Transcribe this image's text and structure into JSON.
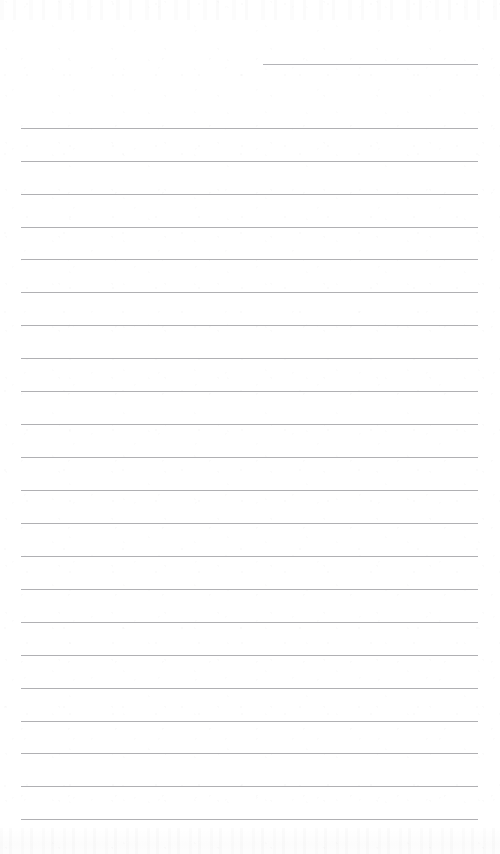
{
  "document": {
    "type": "lined-notebook-page",
    "title": "",
    "page_width": 500,
    "page_height": 854,
    "background_color": "#ffffff",
    "rule_color": "#a9a9ad",
    "rule_thickness_px": 1,
    "content_text": "",
    "is_blank": true
  },
  "layout": {
    "left_margin_x": 21,
    "right_margin_x": 478,
    "full_rule_width": 457,
    "first_full_rule_y": 128,
    "rule_spacing_px": 32.9,
    "full_rule_count": 22
  },
  "header_rule": {
    "name": "signature-rule",
    "label": "",
    "x": 263,
    "y": 64,
    "width": 215
  },
  "rules": [
    {
      "index": 1,
      "y": 128,
      "x": 21,
      "width": 457,
      "value": ""
    },
    {
      "index": 2,
      "y": 161,
      "x": 21,
      "width": 457,
      "value": ""
    },
    {
      "index": 3,
      "y": 194,
      "x": 21,
      "width": 457,
      "value": ""
    },
    {
      "index": 4,
      "y": 227,
      "x": 21,
      "width": 457,
      "value": ""
    },
    {
      "index": 5,
      "y": 259,
      "x": 21,
      "width": 457,
      "value": ""
    },
    {
      "index": 6,
      "y": 292,
      "x": 21,
      "width": 457,
      "value": ""
    },
    {
      "index": 7,
      "y": 325,
      "x": 21,
      "width": 457,
      "value": ""
    },
    {
      "index": 8,
      "y": 358,
      "x": 21,
      "width": 457,
      "value": ""
    },
    {
      "index": 9,
      "y": 391,
      "x": 21,
      "width": 457,
      "value": ""
    },
    {
      "index": 10,
      "y": 424,
      "x": 21,
      "width": 457,
      "value": ""
    },
    {
      "index": 11,
      "y": 457,
      "x": 21,
      "width": 457,
      "value": ""
    },
    {
      "index": 12,
      "y": 490,
      "x": 21,
      "width": 457,
      "value": ""
    },
    {
      "index": 13,
      "y": 523,
      "x": 21,
      "width": 457,
      "value": ""
    },
    {
      "index": 14,
      "y": 556,
      "x": 21,
      "width": 457,
      "value": ""
    },
    {
      "index": 15,
      "y": 589,
      "x": 21,
      "width": 457,
      "value": ""
    },
    {
      "index": 16,
      "y": 622,
      "x": 21,
      "width": 457,
      "value": ""
    },
    {
      "index": 17,
      "y": 655,
      "x": 21,
      "width": 457,
      "value": ""
    },
    {
      "index": 18,
      "y": 688,
      "x": 21,
      "width": 457,
      "value": ""
    },
    {
      "index": 19,
      "y": 721,
      "x": 21,
      "width": 457,
      "value": ""
    },
    {
      "index": 20,
      "y": 753,
      "x": 21,
      "width": 457,
      "value": ""
    },
    {
      "index": 21,
      "y": 786,
      "x": 21,
      "width": 457,
      "value": ""
    },
    {
      "index": 22,
      "y": 819,
      "x": 21,
      "width": 457,
      "value": ""
    }
  ]
}
